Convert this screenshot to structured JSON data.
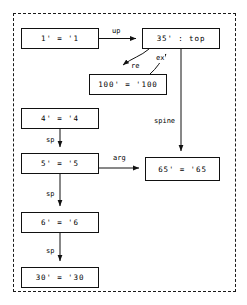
{
  "diagram": {
    "title": "",
    "frame": {
      "style": "dashed"
    },
    "nodes": [
      {
        "id": "n1",
        "label": "1' = '1",
        "x": 21,
        "y": 28,
        "w": 78,
        "h": 21
      },
      {
        "id": "n35",
        "label": "35' : top",
        "x": 142,
        "y": 28,
        "w": 78,
        "h": 21
      },
      {
        "id": "n100",
        "label": "100' = '100",
        "x": 89,
        "y": 74,
        "w": 78,
        "h": 21
      },
      {
        "id": "n4",
        "label": "4' = '4",
        "x": 21,
        "y": 108,
        "w": 78,
        "h": 21
      },
      {
        "id": "n5",
        "label": "5' = '5",
        "x": 21,
        "y": 153,
        "w": 78,
        "h": 21
      },
      {
        "id": "n65",
        "label": "65' = '65",
        "x": 145,
        "y": 157,
        "w": 75,
        "h": 24
      },
      {
        "id": "n6",
        "label": "6' = '6",
        "x": 21,
        "y": 212,
        "w": 78,
        "h": 21
      },
      {
        "id": "n30",
        "label": "30' = '30",
        "x": 21,
        "y": 267,
        "w": 78,
        "h": 21
      }
    ],
    "edges": [
      {
        "id": "e-up",
        "label": "up",
        "from": "n1",
        "to": "n35",
        "label_x": 111,
        "label_y": 27
      },
      {
        "id": "e-re",
        "label": "re",
        "from": "n35",
        "to": "n100",
        "label_x": 130,
        "label_y": 62
      },
      {
        "id": "e-ex",
        "label": "ex",
        "from": "n100",
        "to": "n35",
        "label_x": 155,
        "label_y": 54
      },
      {
        "id": "e-spine",
        "label": "spine",
        "from": "n35",
        "to": "n65",
        "label_x": 153,
        "label_y": 117
      },
      {
        "id": "e-sp1",
        "label": "sp",
        "from": "n4",
        "to": "n5",
        "label_x": 45,
        "label_y": 136
      },
      {
        "id": "e-arg",
        "label": "arg",
        "from": "n5",
        "to": "n65",
        "label_x": 112,
        "label_y": 154
      },
      {
        "id": "e-sp2",
        "label": "sp",
        "from": "n5",
        "to": "n6",
        "label_x": 45,
        "label_y": 190
      },
      {
        "id": "e-sp3",
        "label": "sp",
        "from": "n6",
        "to": "n30",
        "label_x": 45,
        "label_y": 247
      }
    ],
    "colors": {
      "stroke": "#111111",
      "frame": "#1a1a1a",
      "background": "#ffffff",
      "text": "#000000"
    }
  }
}
